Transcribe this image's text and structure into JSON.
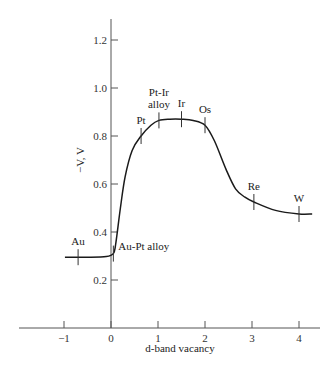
{
  "chart_data": {
    "type": "line",
    "title": "",
    "xlabel": "d-band vacancy",
    "ylabel": "−V, V",
    "xlim": [
      -1.9,
      4.5
    ],
    "ylim": [
      0,
      1.3
    ],
    "xticks": [
      -1,
      0,
      1,
      2,
      3,
      4
    ],
    "xtick_labels": [
      "−1",
      "0",
      "1",
      "2",
      "3",
      "4"
    ],
    "yticks": [
      0.2,
      0.4,
      0.6,
      0.8,
      1.0,
      1.2
    ],
    "ytick_labels": [
      "0.2",
      "0.4",
      "0.6",
      "0.8",
      "1.0",
      "1.2"
    ],
    "grid": false,
    "legend": "none",
    "series": [
      {
        "name": "-V vs d-band vacancy",
        "x": [
          -0.98,
          -0.5,
          -0.1,
          0.05,
          0.1,
          0.2,
          0.3,
          0.45,
          0.64,
          0.85,
          1.02,
          1.25,
          1.5,
          1.75,
          2.0,
          2.2,
          2.45,
          2.65,
          2.85,
          3.04,
          3.5,
          4.0,
          4.28
        ],
        "y": [
          0.295,
          0.295,
          0.298,
          0.31,
          0.35,
          0.5,
          0.63,
          0.74,
          0.8,
          0.845,
          0.865,
          0.87,
          0.87,
          0.865,
          0.845,
          0.78,
          0.66,
          0.58,
          0.545,
          0.525,
          0.49,
          0.475,
          0.475
        ]
      }
    ],
    "annotations": [
      {
        "label": "Au",
        "x": -0.7,
        "y": 0.295,
        "text_pos": "above"
      },
      {
        "label": "Au-Pt alloy",
        "x": 0.05,
        "y": 0.31,
        "text_pos": "right"
      },
      {
        "label": "Pt",
        "x": 0.64,
        "y": 0.8,
        "text_pos": "above"
      },
      {
        "label": "Pt-Ir",
        "label2": "alloy",
        "x": 1.02,
        "y": 0.865,
        "text_pos": "above"
      },
      {
        "label": "Ir",
        "x": 1.5,
        "y": 0.87,
        "text_pos": "above"
      },
      {
        "label": "Os",
        "x": 2.0,
        "y": 0.845,
        "text_pos": "above"
      },
      {
        "label": "Re",
        "x": 3.04,
        "y": 0.525,
        "text_pos": "above"
      },
      {
        "label": "W",
        "x": 4.0,
        "y": 0.475,
        "text_pos": "above"
      }
    ]
  }
}
